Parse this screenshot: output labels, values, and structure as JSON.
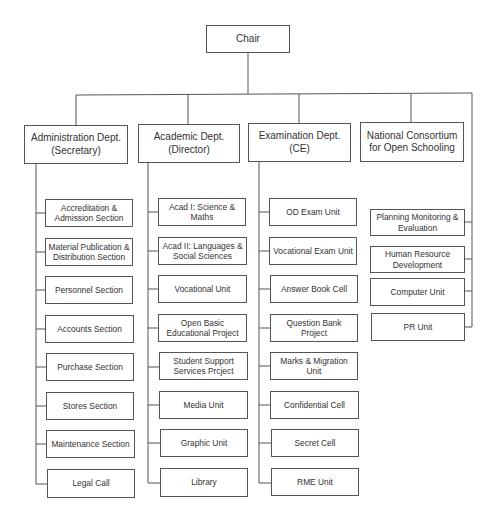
{
  "diagram": {
    "type": "org-chart",
    "root": {
      "label": "Chair"
    },
    "departments": [
      {
        "label": "Administration Dept. (Secretary)",
        "line1": "Administration Dept.",
        "line2": "(Secretary)",
        "children": [
          "Accreditation & Admission Section",
          "Material Publication & Distribution Section",
          "Personnel Section",
          "Accounts Section",
          "Purchase Section",
          "Stores Section",
          "Maintenance Section",
          "Legal Call"
        ]
      },
      {
        "label": "Academic Dept. (Director)",
        "line1": "Academic Dept.",
        "line2": "(Director)",
        "children": [
          "Acad I: Science & Maths",
          "Acad II: Languages & Social Sciences",
          "Vocational Unit",
          "Open Basic Educational Project",
          "Student Support Services Prcject",
          "Media Unit",
          "Graphic Unit",
          "Library"
        ]
      },
      {
        "label": "Examination Dept. (CE)",
        "line1": "Examination Dept.",
        "line2": "(CE)",
        "children": [
          "OD Exam Unit",
          "Vocational Exam Unit",
          "Answer Book Cell",
          "Question Bank Project",
          "Marks & Migration Unit",
          "Confidential Cell",
          "Secret Cell",
          "RME Unit"
        ]
      },
      {
        "label": "National Consortium for Open Schooling",
        "line1": "National Consortium",
        "line2": "for Open Schooling",
        "children": []
      }
    ],
    "chair_direct_units": [
      "Planning Monitoring & Evaluation",
      "Human Resource Development",
      "Computer Unit",
      "PR Unit"
    ]
  }
}
